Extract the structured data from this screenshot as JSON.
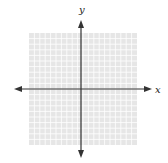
{
  "diagram": {
    "type": "coordinate-plane",
    "x_axis_label": "x",
    "y_axis_label": "y",
    "grid": {
      "columns": 20,
      "rows": 20,
      "line_color": "#ffffff",
      "fill_color": "#e6e6e6"
    },
    "axis_color": "#333333",
    "arrows": [
      "left",
      "right",
      "up",
      "down"
    ]
  }
}
